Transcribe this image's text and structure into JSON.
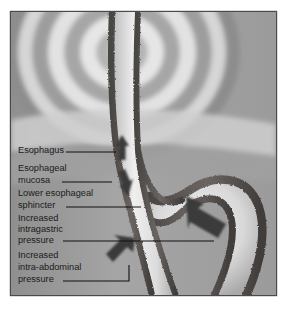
{
  "figure": {
    "frame": {
      "border_color": "#4a4a4a",
      "background_color": "#ffffff"
    },
    "palette": {
      "background_gray": "#9a9a9a",
      "halo_light": "#e8e8e8",
      "halo_mid": "#b8b8b8",
      "halo_dark": "#8a8a8a",
      "tissue_wall": "#5c5754",
      "tissue_wall_dark": "#3e3a38",
      "lumen_light": "#efefef",
      "arrow_fill": "#3a3a3a",
      "leader_line": "#111111",
      "label_text": "#1a1a1a"
    },
    "labels": [
      {
        "id": "esophagus",
        "name": "label-esophagus",
        "lines": [
          "Esophagus"
        ],
        "text_x": 18,
        "line_y": [
          153
        ],
        "leader": {
          "x1": 66,
          "y1": 152,
          "x2": 116,
          "y2": 152
        },
        "target": "esophageal body"
      },
      {
        "id": "esophageal-mucosa",
        "name": "label-esophageal-mucosa",
        "lines": [
          "Esophageal",
          "mucosa"
        ],
        "text_x": 18,
        "line_y": [
          171,
          183
        ],
        "leader": {
          "x1": 62,
          "y1": 182,
          "x2": 112,
          "y2": 182
        },
        "target": "mucosal lining of esophagus"
      },
      {
        "id": "lower-esophageal-sphincter",
        "name": "label-lower-esophageal-sphincter",
        "lines": [
          "Lower esophageal",
          "sphincter"
        ],
        "text_x": 18,
        "line_y": [
          196,
          208
        ],
        "leader": {
          "x1": 66,
          "y1": 207,
          "x2": 141,
          "y2": 207
        },
        "target": "gastroesophageal junction"
      },
      {
        "id": "increased-intragastric-pressure",
        "name": "label-increased-intragastric-pressure",
        "lines": [
          "Increased",
          "intragastric",
          "pressure"
        ],
        "text_x": 18,
        "line_y": [
          221,
          232,
          243
        ],
        "leader": {
          "x1": 63,
          "y1": 241,
          "x2": 214,
          "y2": 241
        },
        "target": "stomach cavity"
      },
      {
        "id": "increased-intra-abdominal-pressure",
        "name": "label-increased-intra-abdominal-pressure",
        "lines": [
          "Increased",
          "intra-abdominal",
          "pressure"
        ],
        "text_x": 18,
        "line_y": [
          258,
          270,
          282
        ],
        "leader_path": "M63,281 L129,281 L129,265",
        "target": "abdominal cavity arrow"
      }
    ],
    "arrows": [
      {
        "id": "reflux-up",
        "name": "arrow-reflux-upward",
        "direction": "up",
        "region": "esophageal lumen"
      },
      {
        "id": "reflux-down",
        "name": "arrow-bolus-downward",
        "direction": "down",
        "region": "esophageal lumen"
      },
      {
        "id": "intragastric",
        "name": "arrow-intragastric-pressure",
        "direction": "up-left",
        "region": "stomach body"
      },
      {
        "id": "intraabdominal",
        "name": "arrow-intra-abdominal-pressure",
        "direction": "up-right",
        "region": "abdomen"
      }
    ],
    "halo": {
      "name": "radiating-concentric-arcs",
      "center_x": 122,
      "center_y": 52,
      "ring_count": 7
    }
  }
}
